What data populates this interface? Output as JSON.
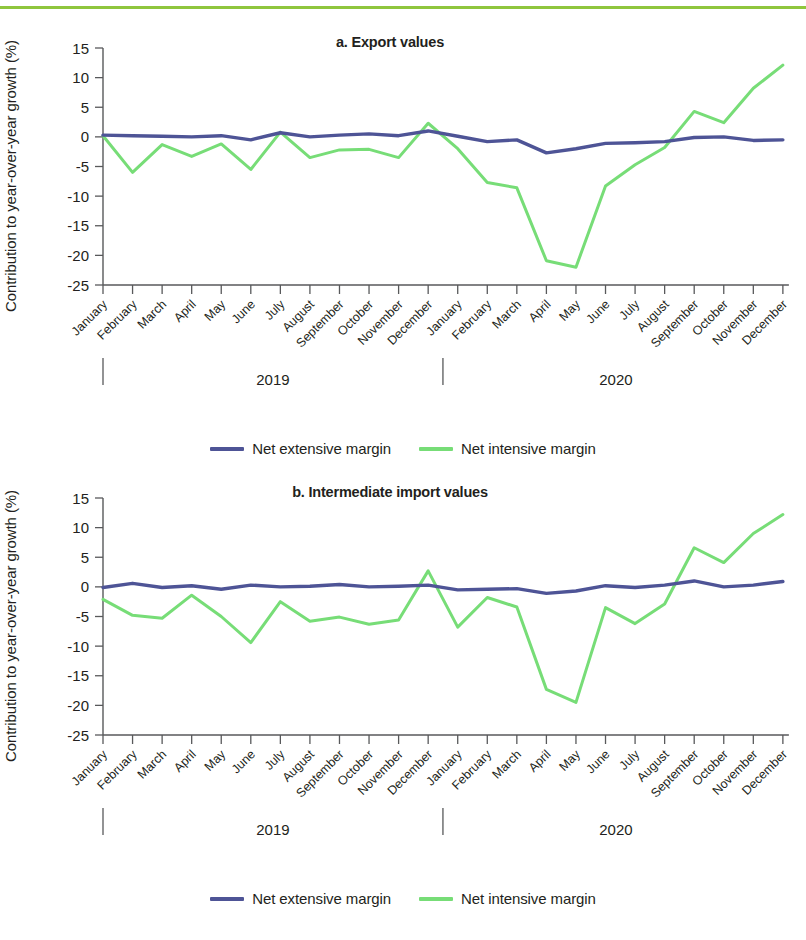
{
  "figure": {
    "ylabel": "Contribution to year-over-year growth (%)",
    "accent_rule_color": "#8fc63d",
    "series_colors": {
      "net_extensive_margin": "#4e5496",
      "net_intensive_margin": "#77dd77"
    },
    "legend": [
      {
        "label": "Net extensive margin",
        "color": "#4e5496"
      },
      {
        "label": "Net intensive margin",
        "color": "#77dd77"
      }
    ],
    "year_labels": [
      "2019",
      "2020"
    ]
  },
  "chart_data": [
    {
      "type": "line",
      "title": "a. Export values",
      "xlabel": "",
      "ylabel": "Contribution to year-over-year growth (%)",
      "ylim": [
        -25,
        15
      ],
      "yticks": [
        15,
        10,
        5,
        0,
        -5,
        -10,
        -15,
        -20,
        -25
      ],
      "ytick_labels": [
        "15",
        "10",
        "5",
        "0",
        "-5",
        "-10",
        "-15",
        "-20",
        "-25"
      ],
      "grid": false,
      "legend_position": "below",
      "group_labels": [
        "2019",
        "2020"
      ],
      "categories": [
        "January",
        "February",
        "March",
        "April",
        "May",
        "June",
        "July",
        "August",
        "September",
        "October",
        "November",
        "December",
        "January",
        "February",
        "March",
        "April",
        "May",
        "June",
        "July",
        "August",
        "September",
        "October",
        "November",
        "December"
      ],
      "series": [
        {
          "name": "Net extensive margin",
          "color": "#4e5496",
          "values": [
            0.3,
            0.2,
            0.1,
            0.0,
            0.2,
            -0.5,
            0.7,
            0.0,
            0.3,
            0.5,
            0.2,
            1.0,
            0.1,
            -0.8,
            -0.5,
            -2.7,
            -2.0,
            -1.1,
            -1.0,
            -0.8,
            -0.1,
            0.0,
            -0.6,
            -0.5
          ]
        },
        {
          "name": "Net intensive margin",
          "color": "#77dd77",
          "values": [
            0.2,
            -6.0,
            -1.3,
            -3.3,
            -1.2,
            -5.5,
            0.8,
            -3.5,
            -2.2,
            -2.1,
            -3.5,
            2.3,
            -2.0,
            -7.7,
            -8.6,
            -20.9,
            -22.0,
            -8.3,
            -4.7,
            -1.8,
            4.3,
            2.4,
            8.2,
            12.1
          ]
        }
      ]
    },
    {
      "type": "line",
      "title": "b. Intermediate import values",
      "xlabel": "",
      "ylabel": "Contribution to year-over-year growth (%)",
      "ylim": [
        -25,
        15
      ],
      "yticks": [
        15,
        10,
        5,
        0,
        -5,
        -10,
        -15,
        -20,
        -25
      ],
      "ytick_labels": [
        "15",
        "10",
        "5",
        "0",
        "-5",
        "-10",
        "-15",
        "-20",
        "-25"
      ],
      "grid": false,
      "legend_position": "below",
      "group_labels": [
        "2019",
        "2020"
      ],
      "categories": [
        "January",
        "February",
        "March",
        "April",
        "May",
        "June",
        "July",
        "August",
        "September",
        "October",
        "November",
        "December",
        "January",
        "February",
        "March",
        "April",
        "May",
        "June",
        "July",
        "August",
        "September",
        "October",
        "November",
        "December"
      ],
      "series": [
        {
          "name": "Net extensive margin",
          "color": "#4e5496",
          "values": [
            -0.1,
            0.6,
            -0.1,
            0.2,
            -0.4,
            0.3,
            0.0,
            0.1,
            0.4,
            0.0,
            0.1,
            0.3,
            -0.5,
            -0.4,
            -0.3,
            -1.1,
            -0.7,
            0.2,
            -0.1,
            0.3,
            1.0,
            0.0,
            0.3,
            0.9
          ]
        },
        {
          "name": "Net intensive margin",
          "color": "#77dd77",
          "values": [
            -2.1,
            -4.8,
            -5.3,
            -1.4,
            -5.0,
            -9.4,
            -2.5,
            -5.8,
            -5.1,
            -6.3,
            -5.6,
            2.7,
            -6.8,
            -1.8,
            -3.4,
            -17.3,
            -19.5,
            -3.5,
            -6.2,
            -2.9,
            6.6,
            4.1,
            9.0,
            12.2
          ]
        }
      ]
    }
  ]
}
